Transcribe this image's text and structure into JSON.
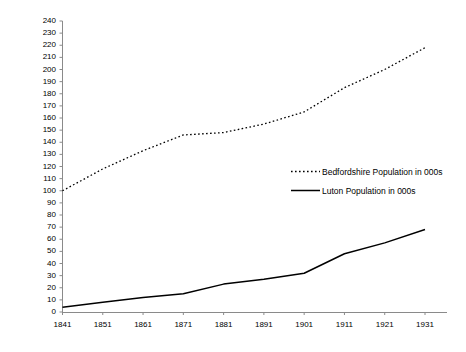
{
  "chart_data": {
    "type": "line",
    "title": "",
    "xlabel": "",
    "ylabel": "",
    "x": [
      1841,
      1851,
      1861,
      1871,
      1881,
      1891,
      1901,
      1911,
      1921,
      1931
    ],
    "xtick_labels": [
      "1841",
      "1851",
      "1861",
      "1871",
      "1881",
      "1891",
      "1901",
      "1911",
      "1921",
      "1931"
    ],
    "ytick_labels": [
      "0",
      "10",
      "20",
      "30",
      "40",
      "50",
      "60",
      "70",
      "80",
      "90",
      "100",
      "110",
      "120",
      "130",
      "140",
      "150",
      "160",
      "170",
      "180",
      "190",
      "200",
      "210",
      "220",
      "230",
      "240"
    ],
    "ylim": [
      0,
      240
    ],
    "ytick_step": 10,
    "xlim": [
      1841,
      1931
    ],
    "grid": false,
    "legend_position": "center-right-inside",
    "series": [
      {
        "name": "Bedfordshire Population in 000s",
        "style": "dotted",
        "color": "#000000",
        "values": [
          100,
          118,
          133,
          146,
          148,
          155,
          165,
          185,
          200,
          218
        ]
      },
      {
        "name": "Luton Population in 000s",
        "style": "solid",
        "color": "#000000",
        "values": [
          4,
          8,
          12,
          15,
          23,
          27,
          32,
          48,
          57,
          68
        ]
      }
    ]
  },
  "legend": {
    "entries": [
      {
        "label": "Bedfordshire Population in 000s",
        "style": "dotted"
      },
      {
        "label": "Luton Population in 000s",
        "style": "solid"
      }
    ]
  },
  "axis_colors": {
    "axis_line": "#808080",
    "tick_mark": "#808080",
    "series_line": "#000000",
    "text": "#000000"
  }
}
